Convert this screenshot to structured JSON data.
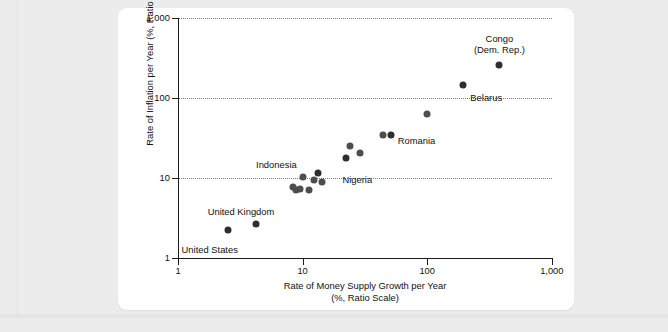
{
  "figure": {
    "background_color": "#ffffff",
    "page_color": "#ededed",
    "dot_color": "#4d4d4d"
  },
  "chart_data": {
    "type": "scatter",
    "title": "",
    "xlabel_line1": "Rate of Money Supply Growth per Year",
    "xlabel_line2": "(%, Ratio Scale)",
    "ylabel_line1": "Rate of Inflation per Year (%, Ratio Scale)",
    "xscale": "log",
    "yscale": "log",
    "xlim": [
      1,
      1000
    ],
    "ylim": [
      1,
      1000
    ],
    "xticks": [
      "1",
      "10",
      "100",
      "1,000"
    ],
    "xtick_values": [
      1,
      10,
      100,
      1000
    ],
    "yticks": [
      "1",
      "10",
      "100",
      "1,000"
    ],
    "ytick_values": [
      1,
      10,
      100,
      1000
    ],
    "grid": "horizontal-dotted",
    "legend": "none",
    "points": [
      {
        "label": "United States",
        "x": 2.5,
        "y": 2.2,
        "label_pos": "below-left"
      },
      {
        "label": "United Kingdom",
        "x": 4.2,
        "y": 2.6,
        "label_pos": "above"
      },
      {
        "label": "",
        "x": 8.4,
        "y": 7.6,
        "label_pos": "none"
      },
      {
        "label": "",
        "x": 8.9,
        "y": 7.1,
        "label_pos": "none"
      },
      {
        "label": "",
        "x": 9.6,
        "y": 7.3,
        "label_pos": "none"
      },
      {
        "label": "",
        "x": 10.0,
        "y": 10.2,
        "label_pos": "none"
      },
      {
        "label": "",
        "x": 11.3,
        "y": 7.0,
        "label_pos": "none"
      },
      {
        "label": "",
        "x": 12.3,
        "y": 9.4,
        "label_pos": "none"
      },
      {
        "label": "Indonesia",
        "x": 13.3,
        "y": 11.5,
        "label_pos": "above-left"
      },
      {
        "label": "",
        "x": 14.4,
        "y": 8.9,
        "label_pos": "none"
      },
      {
        "label": "Nigeria",
        "x": 22.5,
        "y": 17.5,
        "label_pos": "below"
      },
      {
        "label": "",
        "x": 24.0,
        "y": 25.0,
        "label_pos": "none"
      },
      {
        "label": "",
        "x": 29.0,
        "y": 20.5,
        "label_pos": "none"
      },
      {
        "label": "",
        "x": 44.0,
        "y": 34.0,
        "label_pos": "none"
      },
      {
        "label": "Romania",
        "x": 51.0,
        "y": 34.0,
        "label_pos": "right"
      },
      {
        "label": "",
        "x": 100.0,
        "y": 62.0,
        "label_pos": "none"
      },
      {
        "label": "Belarus",
        "x": 195.0,
        "y": 145.0,
        "label_pos": "right"
      },
      {
        "label": "Congo\n(Dem. Rep.)",
        "x": 380.0,
        "y": 255.0,
        "label_pos": "above"
      }
    ],
    "annotations": [
      {
        "text": "Congo",
        "x": 380,
        "y": 255
      },
      {
        "text": "(Dem. Rep.)",
        "x": 380,
        "y": 255
      },
      {
        "text": "Belarus",
        "x": 195,
        "y": 145
      },
      {
        "text": "Romania",
        "x": 51,
        "y": 34
      },
      {
        "text": "Nigeria",
        "x": 22.5,
        "y": 17.5
      },
      {
        "text": "Indonesia",
        "x": 13.3,
        "y": 11.5
      },
      {
        "text": "United Kingdom",
        "x": 4.2,
        "y": 2.6
      },
      {
        "text": "United States",
        "x": 2.5,
        "y": 2.2
      }
    ]
  }
}
